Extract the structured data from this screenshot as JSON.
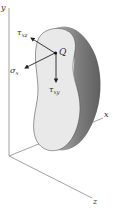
{
  "diagram": {
    "type": "stress-element-3d",
    "axes": {
      "x_label": "x",
      "y_label": "y",
      "z_label": "z"
    },
    "point": {
      "label": "Q"
    },
    "stresses": [
      {
        "symbol": "τ",
        "subscript": "xz",
        "direction": "up-left"
      },
      {
        "symbol": "σ",
        "subscript": "x",
        "direction": "down-left"
      },
      {
        "symbol": "τ",
        "subscript": "xy",
        "direction": "down"
      }
    ],
    "colors": {
      "face": "#e9e9e9",
      "body_shadow": "#7a7a7a",
      "body_mid": "#a8a8a8",
      "axis": "#8a8a8a",
      "arrow": "#222222"
    }
  }
}
